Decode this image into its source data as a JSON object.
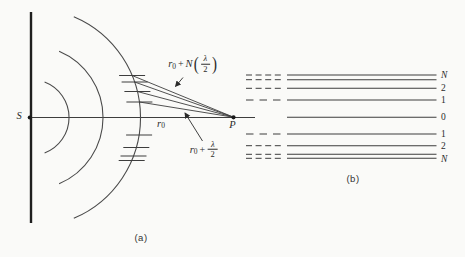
{
  "figure": {
    "background": "#fafaf8",
    "line_color": "#3d3d3d",
    "text_color": "#2b2b2b"
  },
  "panel_a": {
    "caption": "(a)",
    "source_label": "S",
    "point_label": "P",
    "r0_label": {
      "base": "r",
      "sub": "0"
    },
    "ray_top_label": {
      "base": "r",
      "sub": "0",
      "plus": "+",
      "coef": "N",
      "open": "(",
      "num": "λ",
      "den": "2",
      "close": ")"
    },
    "ray_first_label": {
      "base": "r",
      "sub": "0",
      "plus": "+",
      "num": "λ",
      "den": "2"
    }
  },
  "panel_b": {
    "caption": "(b)",
    "levels": [
      {
        "label": "N"
      },
      {
        "label": "2"
      },
      {
        "label": "1"
      },
      {
        "label": "0"
      },
      {
        "label": "1"
      },
      {
        "label": "2"
      },
      {
        "label": "N"
      }
    ]
  }
}
